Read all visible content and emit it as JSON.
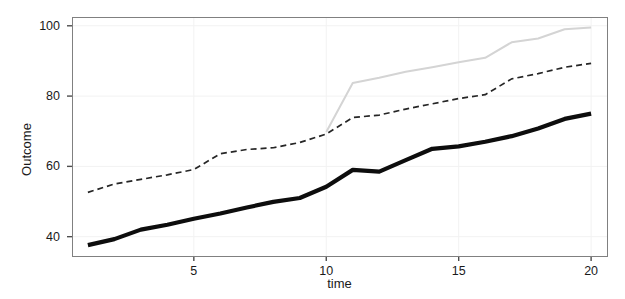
{
  "chart_data": {
    "type": "line",
    "title": "",
    "subtitle": "",
    "xlabel": "time",
    "ylabel": "Outcome",
    "xlim": [
      0.4,
      20.6
    ],
    "ylim": [
      34.5,
      102.5
    ],
    "xticks": [
      5,
      10,
      15,
      20
    ],
    "xtick_labels": [
      "5",
      "10",
      "15",
      "20"
    ],
    "yticks": [
      40,
      60,
      80,
      100
    ],
    "ytick_labels": [
      "40",
      "60",
      "80",
      "100"
    ],
    "grid": true,
    "legend": "none",
    "panel_background": "#ffffff",
    "panel_border_color": "#808080",
    "grid_color": "#f2f2f2",
    "x": [
      1,
      2,
      3,
      4,
      5,
      6,
      7,
      8,
      9,
      10,
      11,
      12,
      13,
      14,
      15,
      16,
      17,
      18,
      19,
      20
    ],
    "series": [
      {
        "name": "solid-black-thick",
        "style": "solid",
        "color": "#0d0d0d",
        "width": 4.2,
        "x": [
          1,
          2,
          3,
          4,
          5,
          6,
          7,
          8,
          9,
          10,
          11,
          12,
          13,
          14,
          15,
          16,
          17,
          18,
          19,
          20
        ],
        "values": [
          37.6,
          39.3,
          42.0,
          43.4,
          45.1,
          46.6,
          48.3,
          49.9,
          51.0,
          54.2,
          59.0,
          58.5,
          61.8,
          65.0,
          65.7,
          67.0,
          68.6,
          70.8,
          73.5,
          75.0
        ]
      },
      {
        "name": "dashed-dark",
        "style": "dashed",
        "color": "#262626",
        "width": 1.7,
        "x": [
          1,
          2,
          3,
          4,
          5,
          6,
          7,
          8,
          9,
          10,
          11,
          12,
          13,
          14,
          15,
          16,
          17,
          18,
          19,
          20
        ],
        "values": [
          52.6,
          55.0,
          56.3,
          57.6,
          59.1,
          63.6,
          64.8,
          65.3,
          66.8,
          69.2,
          73.9,
          74.6,
          76.3,
          77.8,
          79.3,
          80.4,
          84.9,
          86.4,
          88.2,
          89.3
        ]
      },
      {
        "name": "solid-lightgray",
        "style": "solid",
        "color": "#d4d4d4",
        "width": 2.0,
        "x": [
          10,
          11,
          12,
          13,
          14,
          15,
          16,
          17,
          18,
          19,
          20
        ],
        "values": [
          69.8,
          83.7,
          85.2,
          86.9,
          88.2,
          89.6,
          90.9,
          95.3,
          96.4,
          99.0,
          99.5
        ]
      }
    ]
  },
  "axes": {
    "xlabel": "time",
    "ylabel": "Outcome"
  },
  "geometry": {
    "panel_left": 72,
    "panel_right": 607,
    "panel_top": 17,
    "panel_bottom": 256
  }
}
